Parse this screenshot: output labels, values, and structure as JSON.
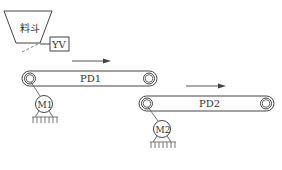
{
  "diagram": {
    "type": "conveyor-system",
    "hopper": {
      "label": "料斗"
    },
    "valve": {
      "label": "YV"
    },
    "belts": [
      {
        "id": "PD1",
        "label": "PD1",
        "motor": "M1",
        "direction": "right"
      },
      {
        "id": "PD2",
        "label": "PD2",
        "motor": "M2",
        "direction": "right"
      }
    ],
    "motors": [
      {
        "id": "M1",
        "label": "M1"
      },
      {
        "id": "M2",
        "label": "M2"
      }
    ],
    "colors": {
      "stroke": "#444444",
      "background": "#ffffff"
    }
  }
}
